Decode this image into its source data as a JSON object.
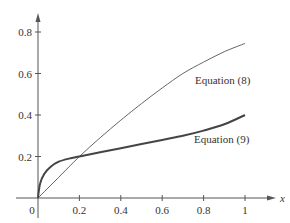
{
  "chart_data": {
    "type": "line",
    "title": "",
    "xlabel": "x",
    "ylabel": "",
    "xlim": [
      0,
      1.12
    ],
    "ylim": [
      0,
      0.88
    ],
    "grid": false,
    "legend": "inline labels",
    "x_ticks": [
      "0.2",
      "0.4",
      "0.6",
      "0.8",
      "1"
    ],
    "y_ticks": [
      "0.2",
      "0.4",
      "0.6",
      "0.8"
    ],
    "origin_label": "0",
    "series": [
      {
        "name": "Equation (8)",
        "style": "thin",
        "x": [
          0,
          0.1,
          0.2,
          0.3,
          0.4,
          0.5,
          0.6,
          0.7,
          0.8,
          0.9,
          1.0
        ],
        "y": [
          0,
          0.1,
          0.2,
          0.29,
          0.375,
          0.455,
          0.53,
          0.6,
          0.655,
          0.705,
          0.745
        ]
      },
      {
        "name": "Equation (9)",
        "style": "thick",
        "x": [
          0,
          0.01,
          0.03,
          0.06,
          0.1,
          0.15,
          0.2,
          0.3,
          0.4,
          0.5,
          0.6,
          0.7,
          0.8,
          0.9,
          1.0
        ],
        "y": [
          0,
          0.07,
          0.115,
          0.15,
          0.175,
          0.19,
          0.2,
          0.22,
          0.24,
          0.26,
          0.28,
          0.3,
          0.325,
          0.355,
          0.4
        ]
      }
    ],
    "annotations": [
      {
        "text": "Equation (8)",
        "x": 0.83,
        "y": 0.43
      },
      {
        "text": "Equation (9)",
        "x": 0.83,
        "y": 0.24
      }
    ]
  },
  "labels": {
    "x_axis_var": "x",
    "origin": "0",
    "x_ticks": [
      "0.2",
      "0.4",
      "0.6",
      "0.8",
      "1"
    ],
    "y_ticks": [
      "0.2",
      "0.4",
      "0.6",
      "0.8"
    ],
    "eq8": "Equation (8)",
    "eq9": "Equation (9)"
  }
}
